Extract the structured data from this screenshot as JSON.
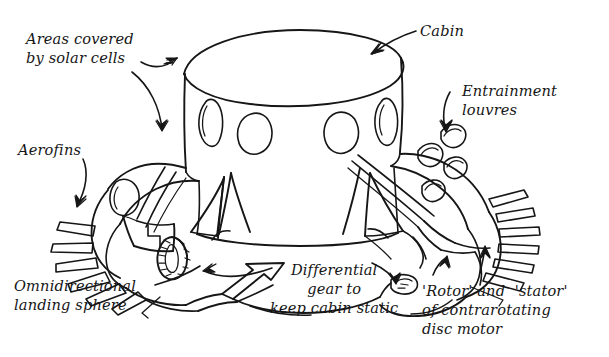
{
  "diagram": {
    "style": "hand-drawn pen line art",
    "ink_color": "#161616",
    "background_color": "#ffffff",
    "width": 609,
    "height": 357
  },
  "labels": {
    "solar_cells": "Areas covered\nby solar cells",
    "aerofins": "Aerofins",
    "omnidirectional_sphere": "Omnidirectional\nlanding sphere",
    "cabin": "Cabin",
    "entrainment_louvres": "Entrainment\nlouvres",
    "differential_gear": "Differential\ngear to\nkeep cabin static",
    "rotor_stator": "'Rotor' and  'stator'\nof contrarotating\ndisc motor"
  },
  "callouts": [
    {
      "name": "solar-cells-upper",
      "label_key": "solar_cells",
      "points_to": "cabin-top-rim-left"
    },
    {
      "name": "solar-cells-lower",
      "label_key": "solar_cells",
      "points_to": "upper-disc-surface-left"
    },
    {
      "name": "aerofins",
      "label_key": "aerofins",
      "points_to": "left-radial-fin-stack"
    },
    {
      "name": "omnidirectional-sphere",
      "label_key": "omnidirectional_sphere",
      "points_to": "lower-landing-sphere-left"
    },
    {
      "name": "cabin",
      "label_key": "cabin",
      "points_to": "cabin-top-rim-right"
    },
    {
      "name": "entrainment-louvres",
      "label_key": "entrainment_louvres",
      "points_to": "right-louvre-scoops"
    },
    {
      "name": "differential-gear",
      "label_key": "differential_gear",
      "points_to": "gear-wheel-and-hub"
    },
    {
      "name": "rotor-stator",
      "label_key": "rotor_stator",
      "points_to": "right-rotor-stator-rim"
    }
  ],
  "drawing_parts": [
    {
      "name": "cabin-cylinder",
      "detail": "upright cylinder with elliptical top deck"
    },
    {
      "name": "cabin-windows",
      "count": 4,
      "detail": "round and oval ports around cabin wall"
    },
    {
      "name": "upper-disc",
      "detail": "saucer body flaring out beneath the cabin"
    },
    {
      "name": "left-aerofin-stack",
      "detail": "radial flat blades projecting left"
    },
    {
      "name": "right-fin-stack",
      "detail": "radial flat blades projecting right"
    },
    {
      "name": "entrainment-louvre-scoops",
      "count": 4,
      "detail": "curved intake scoops on the upper right disc"
    },
    {
      "name": "gear-wheel",
      "detail": "small ribbed differential gear at lower left"
    },
    {
      "name": "landing-sphere",
      "detail": "omnidirectional sphere under the lower hull"
    },
    {
      "name": "rotor-stator-rim",
      "detail": "contrarotating disc motor rim at lower right"
    }
  ]
}
